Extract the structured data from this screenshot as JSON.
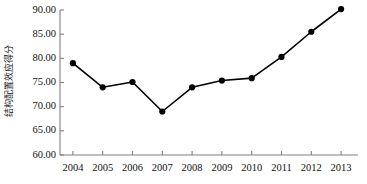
{
  "chart_data": {
    "type": "line",
    "title": "",
    "xlabel": "",
    "ylabel": "结构配置效应得分",
    "categories": [
      "2004",
      "2005",
      "2006",
      "2007",
      "2008",
      "2009",
      "2010",
      "2011",
      "2012",
      "2013"
    ],
    "values": [
      79.0,
      74.0,
      75.1,
      69.0,
      74.0,
      75.4,
      75.9,
      80.3,
      85.5,
      90.2
    ],
    "series": [
      {
        "name": "结构配置效应得分",
        "values": [
          79.0,
          74.0,
          75.1,
          69.0,
          74.0,
          75.4,
          75.9,
          80.3,
          85.5,
          90.2
        ]
      }
    ],
    "ylim": [
      60.0,
      90.0
    ],
    "ytick_labels": [
      "90.00",
      "85.00",
      "80.00",
      "75.00",
      "70.00",
      "65.00",
      "60.00"
    ],
    "ytick_values": [
      90.0,
      85.0,
      80.0,
      75.0,
      70.0,
      65.0,
      60.0
    ],
    "grid": false,
    "legend": "none",
    "line_color": "#000000",
    "marker_color": "#000000",
    "axis_color": "#808080",
    "background_color": "#ffffff"
  }
}
